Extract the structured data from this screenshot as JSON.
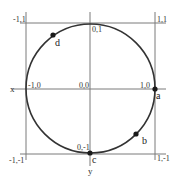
{
  "diagram": {
    "type": "unit-circle",
    "square_corners": {
      "top_left": "-1,1",
      "top_right": "1,1",
      "bottom_left": "-1,-1",
      "bottom_right": "1,-1"
    },
    "axis_points": {
      "origin": "0,0",
      "left": "-1,0",
      "right": "1,0",
      "top": "0,1",
      "bottom": "0,-1"
    },
    "axis_labels": {
      "x": "x",
      "y": "y"
    },
    "points": [
      {
        "label": "a",
        "angle_deg": 0
      },
      {
        "label": "b",
        "angle_deg": -45
      },
      {
        "label": "c",
        "angle_deg": -90
      },
      {
        "label": "d",
        "angle_deg": 135
      }
    ],
    "colors": {
      "circle": "#333333",
      "grid": "#7a7a7a",
      "point": "#1a1a1a"
    }
  }
}
